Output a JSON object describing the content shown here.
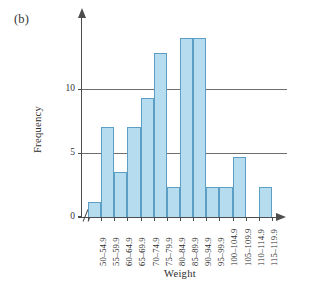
{
  "figure": {
    "panel_label": "(b)"
  },
  "chart_data": {
    "type": "bar",
    "title": "",
    "subtitle": "",
    "xlabel": "Weight",
    "ylabel": "Frequency",
    "categories": [
      "50–54.9",
      "55–59.9",
      "60–64.9",
      "65–69.9",
      "70–74.9",
      "75–79.9",
      "80–84.9",
      "85–89.9",
      "90–94.9",
      "95–99.9",
      "100–104.9",
      "105–109.9",
      "110–114.9",
      "115–119.9"
    ],
    "values": [
      1,
      6,
      3,
      6,
      8,
      11,
      2,
      12,
      12,
      2,
      2,
      4,
      0,
      2
    ],
    "ylim": [
      0,
      13.4
    ],
    "ytick_labels": [
      "0",
      "5",
      "10"
    ],
    "ytick_values": [
      0,
      5,
      10
    ],
    "grid": "horizontal-at-5-and-10",
    "legend": "none",
    "axis_break": "//",
    "bar_fill_color": "#b5dcef",
    "bar_border_color": "#5d9ec4",
    "axis_color": "#4d4d4d",
    "gridline_color": "#6e6e6e"
  }
}
